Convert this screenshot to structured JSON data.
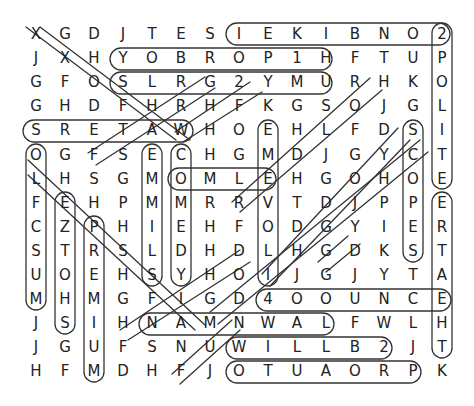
{
  "puzzle": {
    "type": "word-search",
    "cols": 15,
    "rows": 15,
    "grid": [
      [
        "X",
        "G",
        "D",
        "J",
        "T",
        "E",
        "S",
        "I",
        "E",
        "K",
        "I",
        "B",
        "N",
        "O",
        "2"
      ],
      [
        "J",
        "X",
        "H",
        "Y",
        "O",
        "B",
        "R",
        "O",
        "P",
        "1",
        "H",
        "F",
        "T",
        "U",
        "P"
      ],
      [
        "G",
        "F",
        "O",
        "S",
        "L",
        "R",
        "G",
        "2",
        "Y",
        "M",
        "U",
        "R",
        "H",
        "K",
        "O"
      ],
      [
        "G",
        "H",
        "D",
        "F",
        "H",
        "R",
        "H",
        "F",
        "K",
        "G",
        "S",
        "O",
        "J",
        "G",
        "L"
      ],
      [
        "S",
        "R",
        "E",
        "T",
        "A",
        "W",
        "H",
        "O",
        "E",
        "H",
        "L",
        "F",
        "D",
        "S",
        "I"
      ],
      [
        "O",
        "G",
        "F",
        "S",
        "E",
        "C",
        "H",
        "G",
        "M",
        "D",
        "J",
        "G",
        "Y",
        "C",
        "T"
      ],
      [
        "L",
        "H",
        "S",
        "G",
        "M",
        "O",
        "M",
        "L",
        "E",
        "H",
        "G",
        "O",
        "H",
        "O",
        "E"
      ],
      [
        "F",
        "E",
        "H",
        "P",
        "M",
        "M",
        "R",
        "R",
        "V",
        "T",
        "D",
        "J",
        "P",
        "P",
        "E"
      ],
      [
        "C",
        "Z",
        "P",
        "H",
        "I",
        "E",
        "H",
        "F",
        "O",
        "D",
        "G",
        "Y",
        "I",
        "E",
        "R"
      ],
      [
        "S",
        "T",
        "R",
        "S",
        "L",
        "D",
        "H",
        "D",
        "L",
        "H",
        "G",
        "D",
        "K",
        "S",
        "T"
      ],
      [
        "U",
        "O",
        "E",
        "H",
        "S",
        "Y",
        "H",
        "O",
        "I",
        "J",
        "G",
        "J",
        "Y",
        "T",
        "A"
      ],
      [
        "M",
        "H",
        "M",
        "G",
        "F",
        "I",
        "G",
        "D",
        "4",
        "O",
        "O",
        "U",
        "N",
        "C",
        "E"
      ],
      [
        "J",
        "S",
        "I",
        "H",
        "N",
        "A",
        "M",
        "N",
        "W",
        "A",
        "L",
        "F",
        "W",
        "L",
        "H"
      ],
      [
        "J",
        "G",
        "U",
        "F",
        "S",
        "N",
        "U",
        "W",
        "I",
        "L",
        "L",
        "B",
        "2",
        "J",
        "T"
      ],
      [
        "H",
        "F",
        "M",
        "D",
        "H",
        "F",
        "J",
        "O",
        "T",
        "U",
        "A",
        "O",
        "R",
        "P",
        "K"
      ]
    ],
    "found_words": [
      {
        "word": "EKIBNO2",
        "dir": "horizontal",
        "start": [
          0,
          8
        ],
        "end": [
          0,
          14
        ]
      },
      {
        "word": "YOBROP1",
        "dir": "horizontal",
        "start": [
          1,
          3
        ],
        "end": [
          1,
          9
        ]
      },
      {
        "word": "SLRG2YM",
        "dir": "horizontal",
        "start": [
          2,
          3
        ],
        "end": [
          2,
          9
        ]
      },
      {
        "word": "SRETAW",
        "dir": "horizontal",
        "start": [
          4,
          0
        ],
        "end": [
          4,
          5
        ]
      },
      {
        "word": "OMLE",
        "dir": "horizontal",
        "start": [
          6,
          5
        ],
        "end": [
          6,
          8
        ]
      },
      {
        "word": "4OOUNCE",
        "dir": "horizontal",
        "start": [
          11,
          8
        ],
        "end": [
          11,
          14
        ]
      },
      {
        "word": "NAMNWAL",
        "dir": "horizontal",
        "start": [
          12,
          4
        ],
        "end": [
          12,
          10
        ]
      },
      {
        "word": "WILLB2",
        "dir": "horizontal",
        "start": [
          13,
          7
        ],
        "end": [
          13,
          12
        ]
      },
      {
        "word": "OTUAORP",
        "dir": "horizontal",
        "start": [
          14,
          7
        ],
        "end": [
          14,
          13
        ]
      },
      {
        "word": "2POLITE",
        "dir": "vertical",
        "start": [
          0,
          14
        ],
        "end": [
          6,
          14
        ]
      },
      {
        "word": "ERTAHT",
        "dir": "vertical",
        "start": [
          7,
          14
        ],
        "end": [
          13,
          14
        ]
      },
      {
        "word": "SCOPES",
        "dir": "vertical",
        "start": [
          4,
          13
        ],
        "end": [
          9,
          13
        ]
      },
      {
        "word": "EMMILS",
        "dir": "vertical",
        "start": [
          5,
          4
        ],
        "end": [
          10,
          4
        ]
      },
      {
        "word": "COMEDY",
        "dir": "vertical",
        "start": [
          5,
          5
        ],
        "end": [
          10,
          5
        ]
      },
      {
        "word": "EMEVOLI",
        "dir": "vertical",
        "start": [
          4,
          8
        ],
        "end": [
          10,
          8
        ]
      },
      {
        "word": "OLFCSUM",
        "dir": "vertical",
        "start": [
          5,
          0
        ],
        "end": [
          11,
          0
        ]
      },
      {
        "word": "EZTOHS",
        "dir": "vertical",
        "start": [
          7,
          1
        ],
        "end": [
          12,
          1
        ]
      },
      {
        "word": "PREMIUM",
        "dir": "vertical",
        "start": [
          8,
          2
        ],
        "end": [
          14,
          2
        ]
      },
      {
        "word": "XXOFHAW",
        "dir": "diagonal-down-right",
        "start": [
          0,
          0
        ],
        "end": [
          4,
          5
        ]
      },
      {
        "word": "LEPHIDM",
        "dir": "diagonal-down-right",
        "start": [
          6,
          0
        ],
        "end": [
          12,
          6
        ]
      },
      {
        "word": "GRHAS",
        "dir": "diagonal-up-right",
        "start": [
          6,
          2
        ],
        "end": [
          2,
          6
        ]
      },
      {
        "word": "CHK",
        "dir": "diagonal-up-right",
        "start": [
          5,
          5
        ],
        "end": [
          3,
          8
        ]
      },
      {
        "word": "RELOH",
        "dir": "diagonal-up-right",
        "start": [
          7,
          7
        ],
        "end": [
          2,
          12
        ]
      },
      {
        "word": "OLOGJS",
        "dir": "diagonal-up-right",
        "start": [
          10,
          7
        ],
        "end": [
          4,
          13
        ]
      },
      {
        "word": "GH",
        "dir": "diagonal-up-right",
        "start": [
          9,
          10
        ],
        "end": [
          8,
          11
        ]
      },
      {
        "word": "FUN",
        "dir": "diagonal-up-right",
        "start": [
          14,
          5
        ],
        "end": [
          12,
          7
        ]
      }
    ],
    "colors": {
      "text": "#222222",
      "loop": "#333333",
      "background": "#ffffff"
    }
  }
}
